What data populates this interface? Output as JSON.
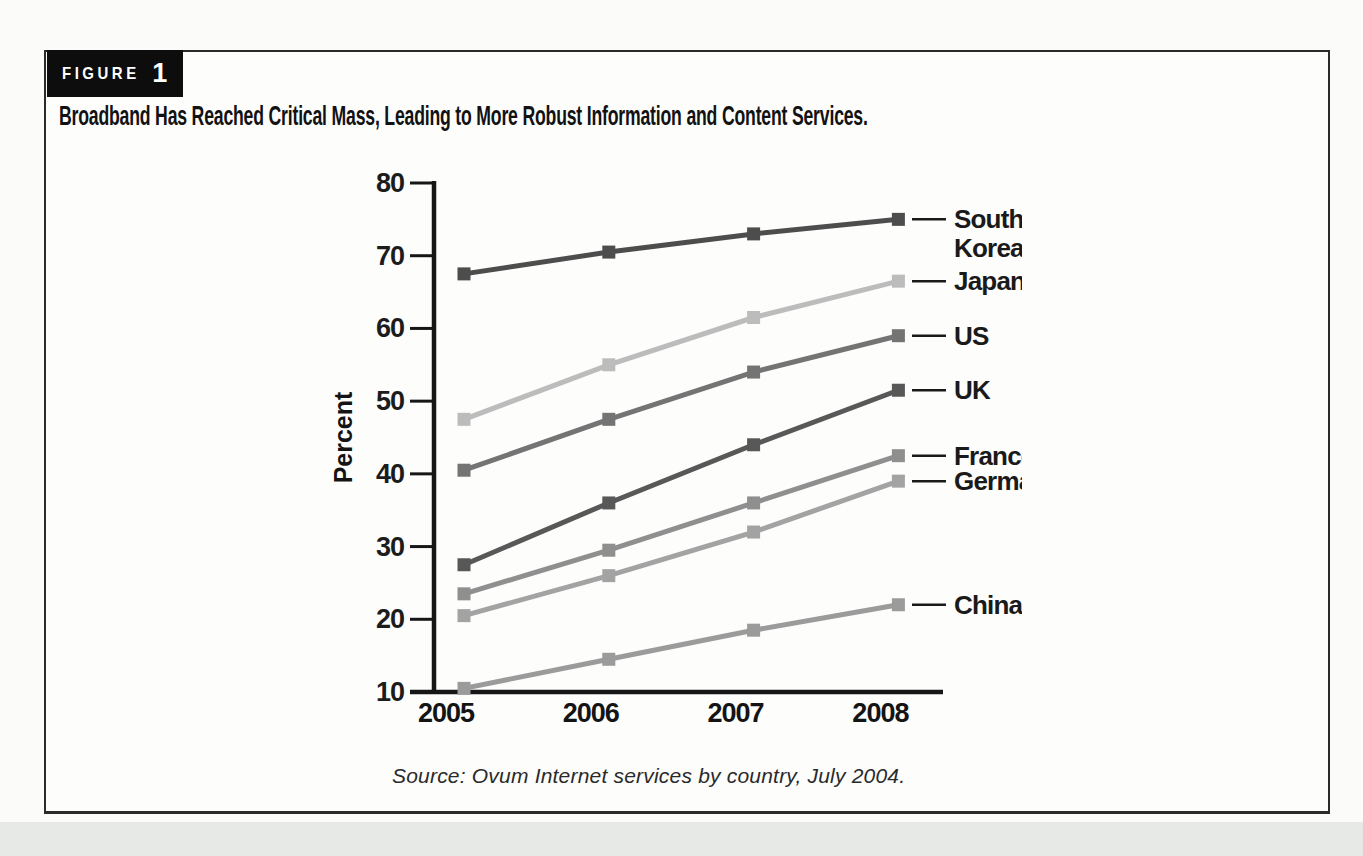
{
  "figure": {
    "label": "FIGURE",
    "number": "1",
    "title": "Broadband Has Reached Critical Mass, Leading to More Robust Information and Content Services.",
    "source": "Source: Ovum Internet services by country, July 2004."
  },
  "chart_data": {
    "type": "line",
    "title": "Broadband Has Reached Critical Mass, Leading to More Robust Information and Content Services.",
    "xlabel": "",
    "ylabel": "Percent",
    "categories": [
      "2005",
      "2006",
      "2007",
      "2008"
    ],
    "ylim": [
      10,
      80
    ],
    "yticks": [
      10,
      20,
      30,
      40,
      50,
      60,
      70,
      80
    ],
    "grid": false,
    "marker": "square",
    "legend_position": "right",
    "axis_color": "#161616",
    "series": [
      {
        "name": "South Korea",
        "label_lines": [
          "South",
          "Korea"
        ],
        "color": "#4d4d4d",
        "values": [
          67.5,
          70.5,
          73,
          75
        ]
      },
      {
        "name": "Japan",
        "label_lines": [
          "Japan"
        ],
        "color": "#bcbcbc",
        "values": [
          47.5,
          55,
          61.5,
          66.5
        ]
      },
      {
        "name": "US",
        "label_lines": [
          "US"
        ],
        "color": "#747474",
        "values": [
          40.5,
          47.5,
          54,
          59
        ]
      },
      {
        "name": "UK",
        "label_lines": [
          "UK"
        ],
        "color": "#585858",
        "values": [
          27.5,
          36,
          44,
          51.5
        ]
      },
      {
        "name": "France",
        "label_lines": [
          "France"
        ],
        "color": "#8f8f8f",
        "values": [
          23.5,
          29.5,
          36,
          42.5
        ]
      },
      {
        "name": "Germany",
        "label_lines": [
          "Germany"
        ],
        "color": "#a3a3a3",
        "values": [
          20.5,
          26,
          32,
          39
        ]
      },
      {
        "name": "China",
        "label_lines": [
          "China"
        ],
        "color": "#9b9b9b",
        "values": [
          10.5,
          14.5,
          18.5,
          22
        ]
      }
    ]
  }
}
